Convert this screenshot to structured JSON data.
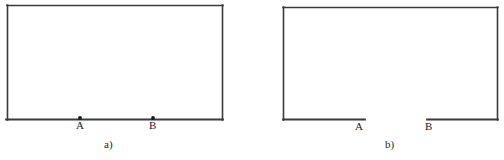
{
  "document": {
    "type": "line-drawing",
    "description": "Two rectangular outlines labelled a) and b); in a) the bottom edge is continuous with marked points A and B, in b) the bottom edge has a gap between A and B",
    "background_color": "#ffffff",
    "stroke_color": "#3a3a3a",
    "stroke_width": 1.5,
    "dot_color": "#1a1a1a"
  },
  "figures": [
    {
      "id": "a",
      "caption": "a)",
      "shape": "closed-rectangle",
      "rect": {
        "x": 7,
        "y": 5,
        "width": 216,
        "height": 115
      },
      "bottom_edge": {
        "continuous": true,
        "y": 120,
        "x_start": 7,
        "x_end": 223
      },
      "points": [
        {
          "id": "A",
          "label": "A",
          "marker": "filled-dot",
          "x": 80,
          "y": 118
        },
        {
          "id": "B",
          "label": "B",
          "marker": "filled-dot",
          "x": 153,
          "y": 118
        }
      ]
    },
    {
      "id": "b",
      "caption": "b)",
      "shape": "rectangle-with-bottom-gap",
      "rect": {
        "x": 283,
        "y": 7,
        "width": 215,
        "height": 113
      },
      "bottom_edge": {
        "continuous": false,
        "y": 120,
        "segments": [
          {
            "x_start": 283,
            "x_end": 365
          },
          {
            "x_start": 427,
            "x_end": 498
          }
        ],
        "gap": {
          "x_start": 365,
          "x_end": 427
        }
      },
      "points": [
        {
          "id": "A",
          "label": "A",
          "marker": "none",
          "x": 365,
          "y": 120
        },
        {
          "id": "B",
          "label": "B",
          "marker": "none",
          "x": 427,
          "y": 120
        }
      ]
    }
  ]
}
